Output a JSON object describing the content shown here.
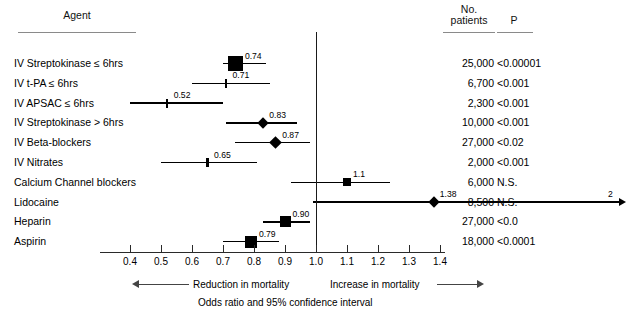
{
  "headers": {
    "agent": "Agent",
    "no_patients": "No.\npatients",
    "no_patients_line1": "No.",
    "no_patients_line2": "patients",
    "p": "P"
  },
  "footer": {
    "reduction": "Reduction in mortality",
    "increase": "Increase in mortality",
    "caption": "Odds ratio and 95% confidence interval"
  },
  "chart_data": {
    "type": "forest",
    "title": "",
    "xlabel": "Odds ratio and 95% confidence interval",
    "ylabel": "Agent",
    "xlim": [
      0.35,
      1.42
    ],
    "reference_line": 1.0,
    "grid": false,
    "legend": "none",
    "xticks": [
      "0.4",
      "0.5",
      "0.6",
      "0.7",
      "0.8",
      "0.9",
      "1.0",
      "1.1",
      "1.2",
      "1.3",
      "1.4"
    ],
    "xtick_values": [
      0.4,
      0.5,
      0.6,
      0.7,
      0.8,
      0.9,
      1.0,
      1.1,
      1.2,
      1.3,
      1.4
    ],
    "columns": [
      "Agent",
      "No. patients",
      "P"
    ],
    "rows": [
      {
        "agent": "IV Streptokinase ≤ 6hrs",
        "odds_ratio": 0.74,
        "estimate_label": "0.74",
        "ci_low": 0.7,
        "ci_high": 0.84,
        "marker": "square",
        "marker_size": 15,
        "no_patients": "25,000",
        "p": "<0.00001"
      },
      {
        "agent": "IV t-PA ≤ 6hrs",
        "odds_ratio": 0.71,
        "estimate_label": "0.71",
        "ci_low": 0.6,
        "ci_high": 0.85,
        "marker": "tick",
        "marker_size": 9,
        "no_patients": "6,700",
        "p": "<0.001"
      },
      {
        "agent": "IV APSAC ≤ 6hrs",
        "odds_ratio": 0.52,
        "estimate_label": "0.52",
        "ci_low": 0.4,
        "ci_high": 0.7,
        "marker": "tick",
        "marker_size": 9,
        "no_patients": "2,300",
        "p": "<0.001"
      },
      {
        "agent": "IV Streptokinase > 6hrs",
        "odds_ratio": 0.83,
        "estimate_label": "0.83",
        "ci_low": 0.71,
        "ci_high": 0.94,
        "marker": "diamond",
        "marker_size": 8,
        "no_patients": "10,000",
        "p": "<0.001"
      },
      {
        "agent": "IV Beta-blockers",
        "odds_ratio": 0.87,
        "estimate_label": "0.87",
        "ci_low": 0.74,
        "ci_high": 0.98,
        "marker": "diamond",
        "marker_size": 9,
        "no_patients": "27,000",
        "p": "<0.02"
      },
      {
        "agent": "IV Nitrates",
        "odds_ratio": 0.65,
        "estimate_label": "0.65",
        "ci_low": 0.5,
        "ci_high": 0.81,
        "marker": "tick",
        "marker_size": 9,
        "no_patients": "2,000",
        "p": "<0.001"
      },
      {
        "agent": "Calcium Channel blockers",
        "odds_ratio": 1.1,
        "estimate_label": "1.1",
        "ci_low": 0.92,
        "ci_high": 1.24,
        "marker": "square",
        "marker_size": 8,
        "no_patients": "6,000",
        "p": "N.S."
      },
      {
        "agent": "Lidocaine",
        "odds_ratio": 1.38,
        "estimate_label": "1.38",
        "ci_low": 0.99,
        "ci_high": 2.0,
        "ci_high_label": "2",
        "arrow_right": true,
        "marker": "diamond",
        "marker_size": 8,
        "no_patients": "8,500",
        "p": "N.S."
      },
      {
        "agent": "Heparin",
        "odds_ratio": 0.9,
        "estimate_label": "0.90",
        "ci_low": 0.83,
        "ci_high": 0.98,
        "marker": "square",
        "marker_size": 11,
        "no_patients": "27,000",
        "p": "<0.0"
      },
      {
        "agent": "Aspirin",
        "odds_ratio": 0.79,
        "estimate_label": "0.79",
        "ci_low": 0.7,
        "ci_high": 0.88,
        "marker": "square",
        "marker_size": 12,
        "no_patients": "18,000",
        "p": "<0.0001"
      }
    ]
  }
}
